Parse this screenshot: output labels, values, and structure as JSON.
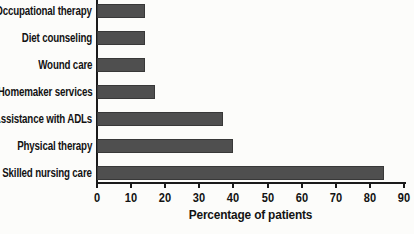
{
  "figure": {
    "background": "#fcfcfa",
    "bar_color": "#4f4f4f",
    "bar_border_color": "#383838",
    "axis_color": "#1a1a1a",
    "text_color": "#131313"
  },
  "chart_data": {
    "type": "bar",
    "orientation": "horizontal",
    "title": "",
    "xlabel": "Percentage of patients",
    "ylabel": "",
    "categories": [
      "Occupational therapy",
      "Diet counseling",
      "Wound care",
      "Homemaker services",
      "Assistance with ADLs",
      "Physical therapy",
      "Skilled nursing care"
    ],
    "values": [
      14,
      14,
      14,
      17,
      37,
      40,
      84
    ],
    "xlim": [
      0,
      90
    ],
    "xticks": [
      0,
      10,
      20,
      30,
      40,
      50,
      60,
      70,
      80,
      90
    ],
    "grid": false,
    "legend": false
  }
}
